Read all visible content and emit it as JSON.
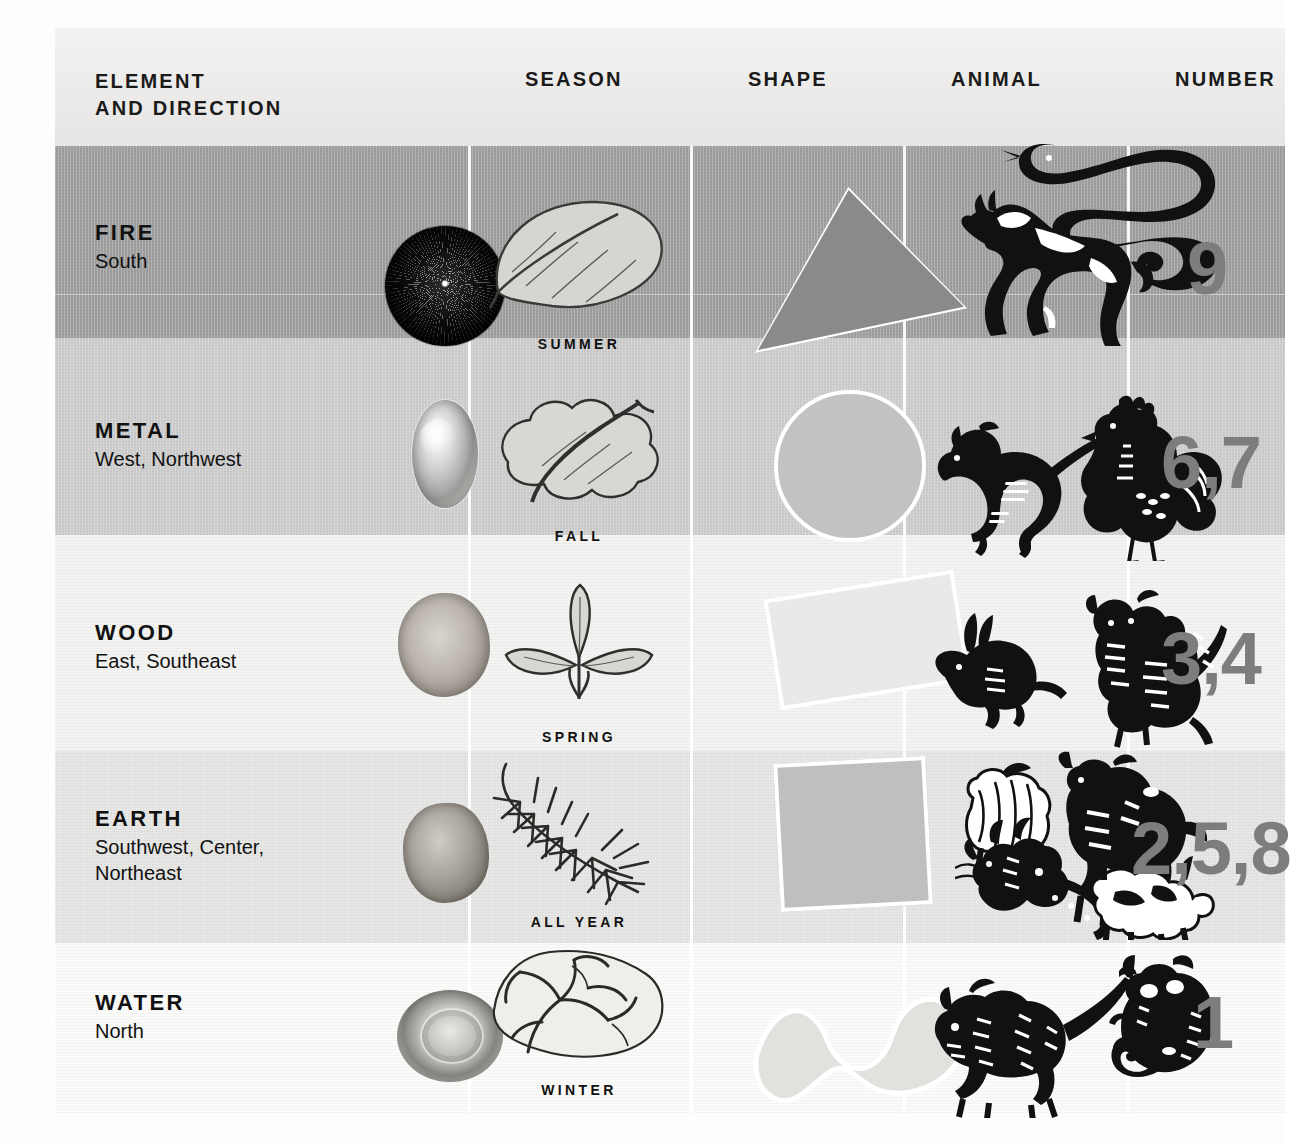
{
  "table": {
    "headers": {
      "element": "ELEMENT\nAND DIRECTION",
      "element_line1": "ELEMENT",
      "element_line2": "AND DIRECTION",
      "season": "SEASON",
      "shape": "SHAPE",
      "animal": "ANIMAL",
      "number": "NUMBER"
    },
    "rows": [
      {
        "element": "FIRE",
        "direction": "South",
        "orb": "fire-orb-dark-radial-burst",
        "season_label": "SUMMER",
        "season_art": "broad-smooth-leaf",
        "shape": "triangle",
        "animals": [
          "horse",
          "snake"
        ],
        "number": "9",
        "row_background": "#9e9e9e"
      },
      {
        "element": "METAL",
        "direction": "West, Northwest",
        "orb": "metal-orb-silver-oval",
        "season_label": "FALL",
        "season_art": "lobed-oak-leaf",
        "shape": "circle",
        "animals": [
          "monkey",
          "rooster"
        ],
        "number": "6,7",
        "row_background": "#cccccc"
      },
      {
        "element": "WOOD",
        "direction": "East, Southeast",
        "orb": "wood-orb-tree-cross-section",
        "season_label": "SPRING",
        "season_art": "sprouting-seedling",
        "shape": "rectangle",
        "animals": [
          "rabbit",
          "tiger"
        ],
        "number": "3,4",
        "row_background": "#f2f2f1"
      },
      {
        "element": "EARTH",
        "direction": "Southwest, Center, Northeast",
        "direction_line1": "Southwest, Center,",
        "direction_line2": "Northeast",
        "orb": "earth-orb-clay-stone",
        "season_label": "ALL YEAR",
        "season_art": "pine-needle-branch",
        "shape": "square",
        "animals": [
          "sheep",
          "ox",
          "dragon",
          "dog"
        ],
        "number": "2,5,8",
        "row_background": "#e4e4e2"
      },
      {
        "element": "WATER",
        "direction": "North",
        "orb": "water-orb-ripple-droplet",
        "season_label": "WINTER",
        "season_art": "bare-branching-vine",
        "shape": "wave",
        "animals": [
          "pig",
          "rat"
        ],
        "number": "1",
        "row_background": "#fafaf8"
      }
    ]
  },
  "colors": {
    "number_gray": "#7d7d7d",
    "text_black": "#111111",
    "separator_white": "#ffffff"
  }
}
